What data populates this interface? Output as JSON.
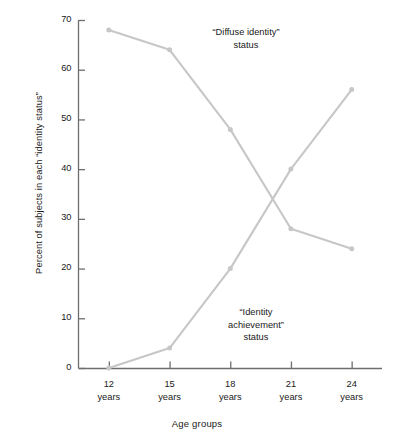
{
  "chart_data": {
    "type": "line",
    "title": "",
    "xlabel": "Age groups",
    "ylabel": "Percent of subjects in each “identity status”",
    "categories": [
      "12 years",
      "15 years",
      "18 years",
      "21 years",
      "24 years"
    ],
    "x": [
      12,
      15,
      18,
      21,
      24
    ],
    "xtick_labels": [
      {
        "age": "12",
        "unit": "years"
      },
      {
        "age": "15",
        "unit": "years"
      },
      {
        "age": "18",
        "unit": "years"
      },
      {
        "age": "21",
        "unit": "years"
      },
      {
        "age": "24",
        "unit": "years"
      }
    ],
    "ytick_labels": [
      "0",
      "10",
      "20",
      "30",
      "40",
      "50",
      "60",
      "70"
    ],
    "yticks": [
      0,
      10,
      20,
      30,
      40,
      50,
      60,
      70
    ],
    "ylim": [
      0,
      70
    ],
    "xlim": [
      10.5,
      25.5
    ],
    "grid": false,
    "legend": "none",
    "series": [
      {
        "name": "“Diffuse identity” status",
        "values": [
          68,
          64,
          48,
          28,
          24
        ],
        "color": "#c7c7c7",
        "marker": "circle"
      },
      {
        "name": "“Identity achievement” status",
        "values": [
          0,
          4,
          20,
          40,
          56
        ],
        "color": "#c7c7c7",
        "marker": "circle"
      }
    ],
    "annotations": [
      {
        "id": "diffuse",
        "text": "“Diffuse identity”\nstatus",
        "x": 16.7,
        "y": 61
      },
      {
        "id": "achievement",
        "text": "“Identity\nachievement”\nstatus",
        "x": 18.6,
        "y": 13
      }
    ],
    "axis_color": "#6e6e6e",
    "text_color": "#1a1a1a"
  }
}
